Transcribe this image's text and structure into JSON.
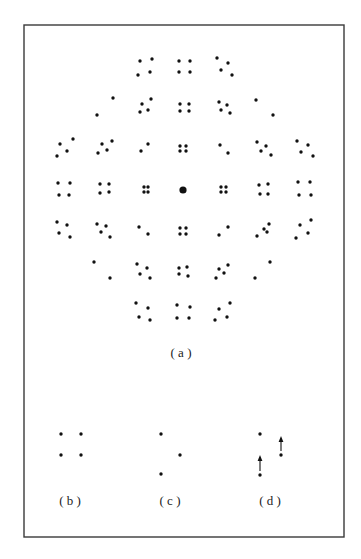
{
  "figure": {
    "frame": {
      "x": 24,
      "y": 25,
      "width": 320,
      "height": 512,
      "stroke": "#3a3a3a"
    },
    "dot_color": "#111111",
    "dot_radius": 1.7,
    "panel_a": {
      "label": "( a )",
      "label_pos": [
        181,
        357
      ],
      "center_dot": {
        "x": 183,
        "y": 190,
        "r": 3.6
      },
      "rows": [
        {
          "name": "row-1",
          "cells": [
            [
              [
                140,
                61
              ],
              [
                152,
                59
              ],
              [
                138,
                75
              ],
              [
                150,
                72
              ]
            ],
            [
              [
                179,
                61
              ],
              [
                190,
                61
              ],
              [
                179,
                72
              ],
              [
                190,
                72
              ]
            ],
            [
              [
                217,
                58
              ],
              [
                228,
                63
              ],
              [
                221,
                70
              ],
              [
                232,
                75
              ]
            ]
          ]
        },
        {
          "name": "row-2",
          "cells": [
            [
              [
                113,
                98
              ],
              [
                97,
                115
              ]
            ],
            [
              [
                142,
                104
              ],
              [
                151,
                99
              ],
              [
                140,
                112
              ],
              [
                148,
                110
              ]
            ],
            [
              [
                180,
                104
              ],
              [
                189,
                104
              ],
              [
                180,
                111
              ],
              [
                189,
                111
              ]
            ],
            [
              [
                219,
                102
              ],
              [
                227,
                105
              ],
              [
                221,
                110
              ],
              [
                230,
                113
              ]
            ],
            [
              [
                256,
                100
              ],
              [
                273,
                115
              ]
            ]
          ]
        },
        {
          "name": "row-3",
          "cells": [
            [
              [
                60,
                144
              ],
              [
                73,
                139
              ],
              [
                67,
                151
              ],
              [
                57,
                156
              ]
            ],
            [
              [
                102,
                144
              ],
              [
                112,
                141
              ],
              [
                107,
                150
              ],
              [
                98,
                153
              ]
            ],
            [
              [
                148,
                144
              ],
              [
                141,
                151
              ]
            ],
            [
              [
                180,
                146
              ],
              [
                186,
                146
              ],
              [
                180,
                151
              ],
              [
                186,
                151
              ]
            ],
            [
              [
                220,
                145
              ],
              [
                228,
                153
              ]
            ],
            [
              [
                257,
                142
              ],
              [
                266,
                146
              ],
              [
                261,
                151
              ],
              [
                271,
                155
              ]
            ],
            [
              [
                297,
                141
              ],
              [
                308,
                145
              ],
              [
                301,
                152
              ],
              [
                313,
                156
              ]
            ]
          ]
        },
        {
          "name": "row-4",
          "cells": [
            [
              [
                58,
                183
              ],
              [
                70,
                183
              ],
              [
                59,
                195
              ],
              [
                69,
                195
              ]
            ],
            [
              [
                100,
                184
              ],
              [
                109,
                184
              ],
              [
                100,
                193
              ],
              [
                109,
                192
              ]
            ],
            [
              [
                144,
                187
              ],
              [
                148,
                187
              ],
              [
                144,
                192
              ],
              [
                148,
                192
              ]
            ],
            [
              [
                221,
                187
              ],
              [
                226,
                187
              ],
              [
                221,
                192
              ],
              [
                226,
                192
              ]
            ],
            [
              [
                259,
                185
              ],
              [
                268,
                184
              ],
              [
                260,
                194
              ],
              [
                268,
                194
              ]
            ],
            [
              [
                298,
                182
              ],
              [
                310,
                182
              ],
              [
                299,
                195
              ],
              [
                311,
                195
              ]
            ]
          ]
        },
        {
          "name": "row-5",
          "cells": [
            [
              [
                57,
                222
              ],
              [
                67,
                225
              ],
              [
                59,
                233
              ],
              [
                70,
                237
              ]
            ],
            [
              [
                97,
                224
              ],
              [
                106,
                226
              ],
              [
                101,
                232
              ],
              [
                110,
                237
              ]
            ],
            [
              [
                139,
                227
              ],
              [
                148,
                234
              ]
            ],
            [
              [
                180,
                228
              ],
              [
                186,
                228
              ],
              [
                180,
                234
              ],
              [
                186,
                234
              ]
            ],
            [
              [
                219,
                235
              ],
              [
                228,
                227
              ]
            ],
            [
              [
                257,
                236
              ],
              [
                264,
                229
              ],
              [
                267,
                232
              ],
              [
                269,
                224
              ]
            ],
            [
              [
                296,
                238
              ],
              [
                300,
                225
              ],
              [
                308,
                233
              ],
              [
                311,
                220
              ]
            ]
          ]
        },
        {
          "name": "row-6",
          "cells": [
            [
              [
                94,
                262
              ],
              [
                110,
                278
              ]
            ],
            [
              [
                137,
                264
              ],
              [
                147,
                268
              ],
              [
                140,
                274
              ],
              [
                150,
                278
              ]
            ],
            [
              [
                179,
                268
              ],
              [
                187,
                267
              ],
              [
                179,
                274
              ],
              [
                188,
                276
              ]
            ],
            [
              [
                216,
                278
              ],
              [
                219,
                269
              ],
              [
                224,
                273
              ],
              [
                228,
                265
              ]
            ],
            [
              [
                255,
                278
              ],
              [
                270,
                262
              ]
            ]
          ]
        },
        {
          "name": "row-7",
          "cells": [
            [
              [
                136,
                303
              ],
              [
                148,
                308
              ],
              [
                139,
                317
              ],
              [
                150,
                320
              ]
            ],
            [
              [
                177,
                305
              ],
              [
                190,
                307
              ],
              [
                177,
                318
              ],
              [
                189,
                318
              ]
            ],
            [
              [
                215,
                320
              ],
              [
                219,
                309
              ],
              [
                227,
                317
              ],
              [
                230,
                303
              ]
            ]
          ]
        }
      ]
    },
    "panel_b": {
      "label": "( b )",
      "label_pos": [
        70,
        505
      ],
      "dots": [
        [
          61,
          434
        ],
        [
          81,
          434
        ],
        [
          61,
          455
        ],
        [
          81,
          455
        ]
      ]
    },
    "panel_c": {
      "label": "( c )",
      "label_pos": [
        170,
        505
      ],
      "dots": [
        [
          161,
          434
        ],
        [
          180,
          455
        ],
        [
          161,
          474
        ]
      ]
    },
    "panel_d": {
      "label": "( d )",
      "label_pos": [
        270,
        505
      ],
      "dots": [
        [
          260,
          434
        ],
        [
          281,
          455
        ],
        [
          260,
          475
        ]
      ],
      "arrows": [
        {
          "from": [
            260,
            471
          ],
          "to": [
            260,
            455
          ]
        },
        {
          "from": [
            281,
            451
          ],
          "to": [
            281,
            436
          ]
        }
      ]
    }
  }
}
